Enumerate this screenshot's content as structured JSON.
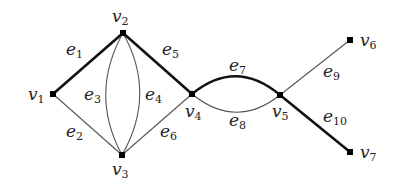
{
  "graph": {
    "vertices": [
      {
        "id": "v1",
        "name": "v",
        "sub": "1",
        "x": 53,
        "y": 94,
        "lx": 28,
        "ly": 100
      },
      {
        "id": "v2",
        "name": "v",
        "sub": "2",
        "x": 123,
        "y": 33,
        "lx": 112,
        "ly": 22
      },
      {
        "id": "v3",
        "name": "v",
        "sub": "3",
        "x": 122,
        "y": 155,
        "lx": 112,
        "ly": 175
      },
      {
        "id": "v4",
        "name": "v",
        "sub": "4",
        "x": 192,
        "y": 94,
        "lx": 185,
        "ly": 117
      },
      {
        "id": "v5",
        "name": "v",
        "sub": "5",
        "x": 280,
        "y": 95,
        "lx": 272,
        "ly": 117
      },
      {
        "id": "v6",
        "name": "v",
        "sub": "6",
        "x": 350,
        "y": 40,
        "lx": 360,
        "ly": 46
      },
      {
        "id": "v7",
        "name": "v",
        "sub": "7",
        "x": 350,
        "y": 152,
        "lx": 360,
        "ly": 158
      }
    ],
    "edges": [
      {
        "id": "e1",
        "name": "e",
        "sub": "1",
        "from": "v1",
        "to": "v2",
        "thick": true,
        "d": "M53,94 L123,33",
        "lx": 66,
        "ly": 55
      },
      {
        "id": "e2",
        "name": "e",
        "sub": "2",
        "from": "v1",
        "to": "v3",
        "thick": false,
        "d": "M53,94 L122,155",
        "lx": 66,
        "ly": 137
      },
      {
        "id": "e3",
        "name": "e",
        "sub": "3",
        "from": "v2",
        "to": "v3",
        "thick": false,
        "d": "M123,33 Q89,94 122,155",
        "lx": 84,
        "ly": 100
      },
      {
        "id": "e4",
        "name": "e",
        "sub": "4",
        "from": "v2",
        "to": "v3",
        "thick": false,
        "d": "M123,33 Q157,94 122,155",
        "lx": 145,
        "ly": 100
      },
      {
        "id": "e5",
        "name": "e",
        "sub": "5",
        "from": "v2",
        "to": "v4",
        "thick": true,
        "d": "M123,33 L192,94",
        "lx": 162,
        "ly": 55
      },
      {
        "id": "e6",
        "name": "e",
        "sub": "6",
        "from": "v3",
        "to": "v4",
        "thick": false,
        "d": "M122,155 L192,94",
        "lx": 160,
        "ly": 137
      },
      {
        "id": "e7",
        "name": "e",
        "sub": "7",
        "from": "v4",
        "to": "v5",
        "thick": true,
        "d": "M192,94 Q236,58 280,95",
        "lx": 229,
        "ly": 71
      },
      {
        "id": "e8",
        "name": "e",
        "sub": "8",
        "from": "v4",
        "to": "v5",
        "thick": false,
        "d": "M192,94 Q236,130 280,95",
        "lx": 229,
        "ly": 126
      },
      {
        "id": "e9",
        "name": "e",
        "sub": "9",
        "from": "v5",
        "to": "v6",
        "thick": false,
        "d": "M280,95 L350,40",
        "lx": 323,
        "ly": 77
      },
      {
        "id": "e10",
        "name": "e",
        "sub": "10",
        "from": "v5",
        "to": "v7",
        "thick": true,
        "d": "M280,95 L350,152",
        "lx": 323,
        "ly": 122
      }
    ]
  }
}
